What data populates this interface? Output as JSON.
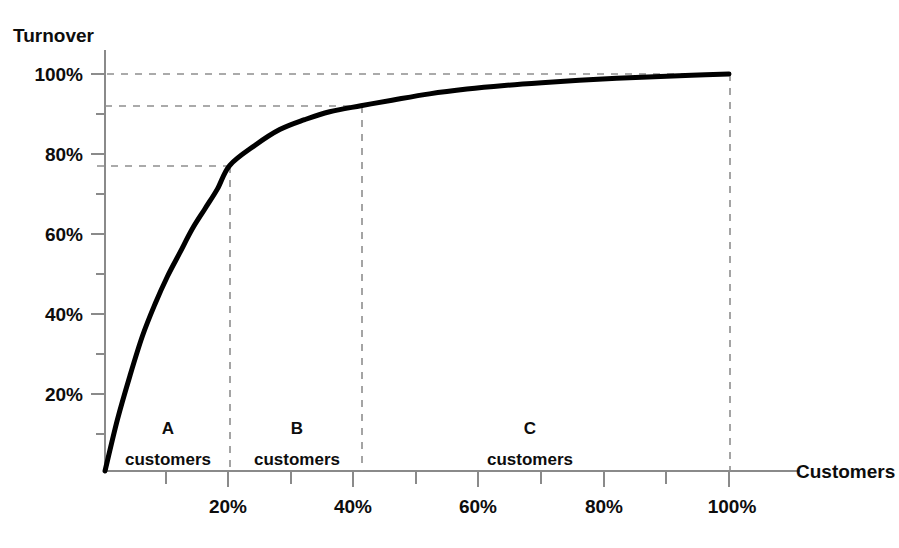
{
  "chart_data": {
    "type": "line",
    "title": "",
    "xlabel": "Customers",
    "ylabel": "Turnover",
    "xlim": [
      0,
      110
    ],
    "ylim": [
      0,
      107
    ],
    "grid": false,
    "legend": null,
    "x_ticks_major": [
      "20%",
      "40%",
      "60%",
      "80%",
      "100%"
    ],
    "x_tick_values_major": [
      20,
      40,
      60,
      80,
      100
    ],
    "x_tick_values_minor": [
      10,
      30,
      50,
      70,
      90
    ],
    "y_ticks_major": [
      "20%",
      "40%",
      "60%",
      "80%",
      "100%"
    ],
    "y_tick_values_major": [
      20,
      40,
      60,
      80,
      100
    ],
    "y_tick_values_minor": [
      10,
      30,
      50,
      70,
      90,
      110
    ],
    "series": [
      {
        "name": "Cumulative turnover",
        "x": [
          0,
          2,
          4,
          6,
          8,
          10,
          12,
          14,
          16,
          18,
          20,
          24,
          28,
          32,
          36,
          41,
          46,
          52,
          58,
          64,
          70,
          76,
          82,
          88,
          94,
          100
        ],
        "values": [
          0,
          13,
          24,
          34,
          42,
          49,
          55,
          61,
          66,
          71,
          77,
          82,
          86,
          88.5,
          90.5,
          92,
          93.4,
          95,
          96.2,
          97.1,
          97.8,
          98.4,
          98.9,
          99.3,
          99.7,
          100
        ]
      }
    ],
    "annotations": [
      {
        "name": "guide-100",
        "type": "hline",
        "y": 100,
        "x_from": 0,
        "x_to": 100,
        "style": "dashed"
      },
      {
        "name": "guide-92",
        "type": "hline",
        "y": 92,
        "x_from": 0,
        "x_to": 41,
        "style": "dashed"
      },
      {
        "name": "guide-77",
        "type": "hline",
        "y": 77,
        "x_from": 0,
        "x_to": 20,
        "style": "dashed"
      },
      {
        "name": "guide-20",
        "type": "vline",
        "x": 20,
        "y_from": 0,
        "y_to": 77,
        "style": "dashed"
      },
      {
        "name": "guide-41",
        "type": "vline",
        "x": 41,
        "y_from": 0,
        "y_to": 92,
        "style": "dashed"
      },
      {
        "name": "guide-100-v",
        "type": "vline",
        "x": 100,
        "y_from": 0,
        "y_to": 100,
        "style": "dashed"
      }
    ],
    "segments": [
      {
        "letter": "A",
        "word": "customers",
        "x_from": 0,
        "x_to": 20,
        "label_x": 10
      },
      {
        "letter": "B",
        "word": "customers",
        "x_from": 20,
        "x_to": 41,
        "label_x": 30
      },
      {
        "letter": "C",
        "word": "customers",
        "x_from": 41,
        "x_to": 100,
        "label_x": 68
      }
    ]
  },
  "axes": {
    "y_axis_title": "Turnover",
    "x_axis_title": "Customers"
  },
  "y_tick_labels": [
    "100%",
    "80%",
    "60%",
    "40%",
    "20%"
  ],
  "x_tick_labels": [
    "20%",
    "40%",
    "60%",
    "80%",
    "100%"
  ],
  "segments": {
    "a_letter": "A",
    "a_word": "customers",
    "b_letter": "B",
    "b_word": "customers",
    "c_letter": "C",
    "c_word": "customers"
  },
  "colors": {
    "curve": "#000000",
    "axis": "#8a8a8a",
    "guide": "#8e8e8e",
    "text": "#0d0d0d",
    "background": "#ffffff"
  }
}
